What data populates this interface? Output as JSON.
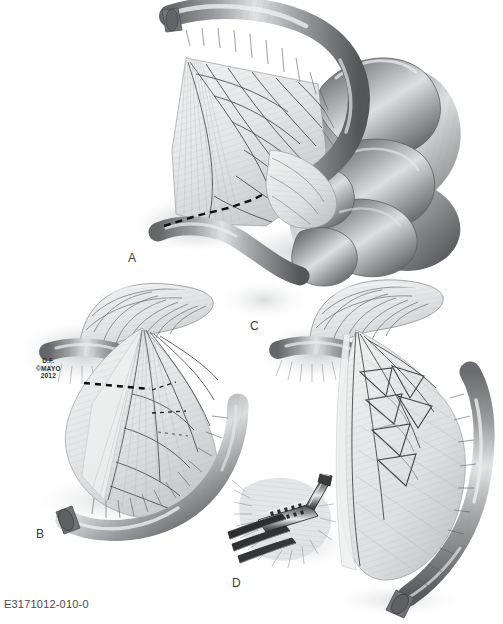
{
  "figure": {
    "medium": "grayscale medical illustration",
    "background_color": "#ffffff",
    "ink_color": "#3a3a3a",
    "width": 503,
    "height": 624
  },
  "catalog": {
    "number": "E3171012-010-0"
  },
  "copyright": {
    "artist_initials": "D.F.",
    "holder": "©MAYO",
    "year": "2012"
  },
  "panels": [
    {
      "id": "a",
      "label": "A",
      "caption": "Small bowel loop with fan-shaped mesentery; coiled intestine at right; dashed resection line across distal mesentery and bowel",
      "features": [
        "colon-segment",
        "mesentery-fan",
        "vascular-arcade",
        "coiled-small-bowel",
        "dashed-resection-line"
      ]
    },
    {
      "id": "b",
      "label": "B",
      "caption": "Isolated bowel segment with mesentery, showing horizontal dashed division lines through mesenteric vessels",
      "features": [
        "bowel-loop",
        "mesentery-fan",
        "vascular-arcade",
        "dashed-division-line-proximal",
        "dashed-division-line-distal"
      ]
    },
    {
      "id": "c",
      "label": "C",
      "caption": "Bowel segment after mesenteric windows are created, vessel arcades skeletonized",
      "features": [
        "bowel-loop",
        "mesentery-fan",
        "mesenteric-windows",
        "vascular-arcade"
      ]
    },
    {
      "id": "d",
      "label": "D",
      "caption": "Inset detail: linear surgical stapler applied across the bowel with retracting instruments",
      "features": [
        "linear-stapler",
        "retractor-blades",
        "bowel-wall",
        "staple-line"
      ]
    }
  ],
  "palette": {
    "bowel_dark": "#55575a",
    "bowel_mid": "#8c8e91",
    "bowel_light": "#d8dadc",
    "mesentery_light": "#eceded",
    "mesentery_shade": "#c2c4c6",
    "vessel_line": "#4b4c4e",
    "dashed_line": "#1a1a1a",
    "shadow": "#cfd1d3",
    "metal_dark": "#3c3e40",
    "metal_light": "#e2e4e6"
  }
}
